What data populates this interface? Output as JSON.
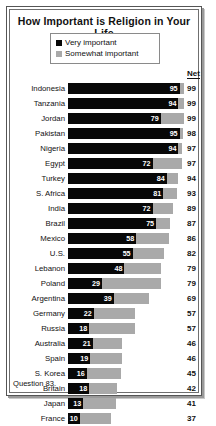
{
  "chart_data": {
    "type": "bar",
    "title": "How Important is Religion in Your Life",
    "subtitle": "",
    "xlabel": "",
    "ylabel": "",
    "orientation": "horizontal",
    "stacked": true,
    "grid": false,
    "legend_position": "top-center",
    "xlim": [
      0,
      100
    ],
    "net_column_header": "Net",
    "legend": [
      {
        "name": "Very important",
        "color": "#080808"
      },
      {
        "name": "Somewhat important",
        "color": "#a9a9a9"
      }
    ],
    "categories": [
      "Indonesia",
      "Tanzania",
      "Jordan",
      "Pakistan",
      "Nigeria",
      "Egypt",
      "Turkey",
      "S. Africa",
      "India",
      "Brazil",
      "Mexico",
      "U.S.",
      "Lebanon",
      "Poland",
      "Argentina",
      "Germany",
      "Russia",
      "Australia",
      "Spain",
      "S. Korea",
      "Britain",
      "Japan",
      "France"
    ],
    "series": [
      {
        "name": "Very important",
        "color": "#080808",
        "values": [
          95,
          94,
          79,
          95,
          94,
          72,
          84,
          81,
          72,
          75,
          58,
          55,
          48,
          29,
          39,
          22,
          18,
          21,
          19,
          16,
          18,
          13,
          10
        ]
      },
      {
        "name": "Somewhat important",
        "color": "#a9a9a9",
        "values": [
          4,
          5,
          20,
          3,
          3,
          25,
          10,
          12,
          17,
          12,
          28,
          27,
          31,
          50,
          30,
          35,
          39,
          25,
          27,
          29,
          24,
          28,
          27
        ]
      }
    ],
    "net": [
      99,
      99,
      99,
      98,
      97,
      97,
      94,
      93,
      89,
      87,
      86,
      82,
      79,
      79,
      69,
      57,
      57,
      46,
      46,
      45,
      42,
      41,
      37
    ]
  },
  "footnote": "Question 83."
}
